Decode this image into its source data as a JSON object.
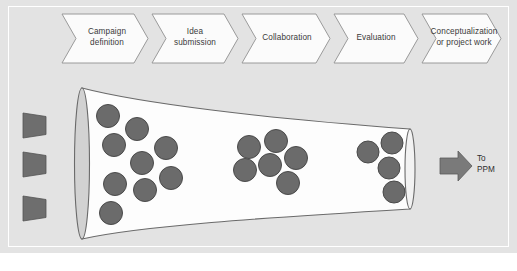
{
  "diagram": {
    "background_color": "#e3e3e3",
    "process_stages": [
      {
        "id": "campaign-definition",
        "label": "Campaign\ndefinition"
      },
      {
        "id": "idea-submission",
        "label": "Idea\nsubmission"
      },
      {
        "id": "collaboration",
        "label": "Collaboration"
      },
      {
        "id": "evaluation",
        "label": "Evaluation"
      },
      {
        "id": "conceptualization",
        "label": "Conceptualization\nor project work"
      }
    ],
    "input_arrows": {
      "count": 3,
      "color": "#6e6e6e",
      "label": ""
    },
    "funnel": {
      "fill": "#fdfdfd",
      "outline": "#6a6a6a",
      "mouth_fill": "#d2d2d2",
      "neck_fill": "#d2d2d2"
    },
    "idea_clusters": [
      {
        "stage": "intake",
        "count": 9
      },
      {
        "stage": "middle",
        "count": 6
      },
      {
        "stage": "output",
        "count": 4
      }
    ],
    "idea_dot": {
      "fill": "#6b6b6b",
      "stroke": "#4a4a4a"
    },
    "output": {
      "label": "To\nPPM",
      "arrow_color": "#7a7a7a"
    }
  }
}
